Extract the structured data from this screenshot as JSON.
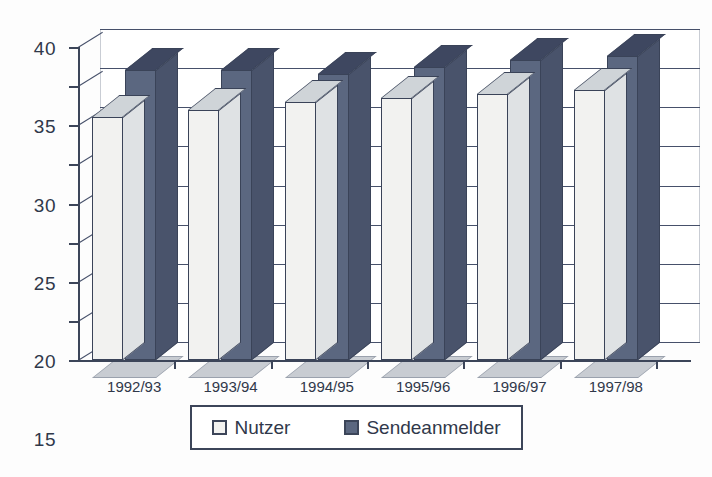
{
  "chart_data": {
    "type": "bar",
    "title": "",
    "subtitle": "",
    "xlabel": "",
    "ylabel": "",
    "ylim": [
      0,
      40
    ],
    "ytick_step": 5,
    "yticks": [
      "40",
      "35",
      "30",
      "25",
      "20",
      "15",
      "10",
      "5",
      "0"
    ],
    "grid": true,
    "style": "3d-clustered-column",
    "legend_position": "bottom",
    "categories": [
      "1992/93",
      "1993/94",
      "1994/95",
      "1995/96",
      "1996/97",
      "1997/98"
    ],
    "series": [
      {
        "name": "Nutzer",
        "color": "#f2f2f0",
        "values": [
          31,
          32,
          33,
          33.5,
          34,
          34.5
        ]
      },
      {
        "name": "Sendeanmelder",
        "color": "#5b6780",
        "values": [
          37,
          37,
          36.5,
          37.5,
          38.3,
          38.8
        ]
      }
    ]
  },
  "legend": {
    "items": [
      {
        "label": "Nutzer",
        "swatch": "legend-swatch-nutzer",
        "color": "#f2f2f0"
      },
      {
        "label": "Sendeanmelder",
        "swatch": "legend-swatch-sendeanmelder",
        "color": "#5b6780"
      }
    ]
  },
  "colors": {
    "axis": "#3c4559",
    "grid": "#46506a",
    "background": "#fdfdfd",
    "bar_light": "#f2f2f0",
    "bar_dark": "#5b6780",
    "floor": "#c8ccd2"
  }
}
